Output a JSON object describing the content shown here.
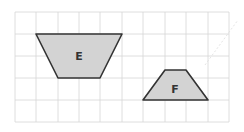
{
  "diagram": {
    "type": "grid-shapes",
    "grid": {
      "columns": 10,
      "rows": 5,
      "origin_x": 15,
      "origin_y": 12,
      "cell_w": 21.4,
      "cell_h": 22,
      "line_color": "#d4d4d4"
    },
    "shapes": [
      {
        "label": "E",
        "kind": "trapezoid",
        "points": "36,34 122,34 100,78 58,78",
        "label_x": 79,
        "label_y": 60,
        "fill": "#d3d3d3",
        "stroke": "#333333"
      },
      {
        "label": "F",
        "kind": "trapezoid",
        "points": "165,70 186,70 208,100 143,100",
        "label_x": 175,
        "label_y": 93,
        "fill": "#d3d3d3",
        "stroke": "#333333"
      }
    ]
  }
}
